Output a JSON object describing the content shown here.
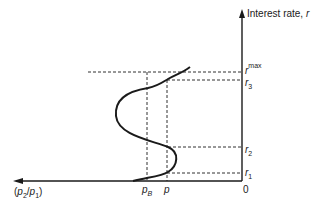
{
  "diagram": {
    "y_axis": {
      "label": "Interest rate, ",
      "label_var": "r",
      "origin_label": "0"
    },
    "x_axis": {
      "label_open": "(",
      "label_p2": "p",
      "label_p2_sub": "2",
      "label_slash": "/",
      "label_p1": "p",
      "label_p1_sub": "1",
      "label_close": ")"
    },
    "r_levels": [
      {
        "name": "r_max",
        "base": "r",
        "sup": "max",
        "y": 72
      },
      {
        "name": "r3",
        "base": "r",
        "sub": "3",
        "y": 80
      },
      {
        "name": "r2",
        "base": "r",
        "sub": "2",
        "y": 147
      },
      {
        "name": "r1",
        "base": "r",
        "sub": "1",
        "y": 173
      }
    ],
    "p_levels": [
      {
        "name": "pB",
        "base": "p",
        "sub": "B",
        "x": 147
      },
      {
        "name": "p",
        "base": "p",
        "x": 167
      }
    ],
    "colors": {
      "line": "#1a1a1a",
      "background": "#ffffff"
    }
  }
}
